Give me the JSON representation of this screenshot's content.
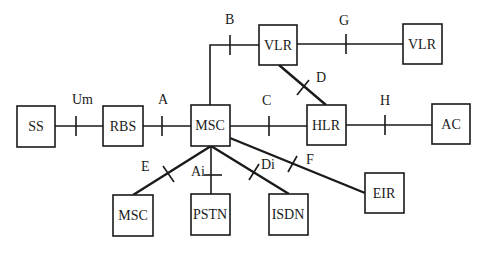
{
  "diagram": {
    "title": "",
    "nodes": {
      "ss": "SS",
      "rbs": "RBS",
      "msc": "MSC",
      "hlr": "HLR",
      "ac": "AC",
      "vlr1": "VLR",
      "vlr2": "VLR",
      "msc2": "MSC",
      "pstn": "PSTN",
      "isdn": "ISDN",
      "eir": "EIR"
    },
    "interfaces": {
      "um": "Um",
      "a": "A",
      "b": "B",
      "c": "C",
      "d": "D",
      "e": "E",
      "f": "F",
      "g": "G",
      "h": "H",
      "ai": "Ai",
      "di": "Di"
    },
    "edges": [
      {
        "from": "SS",
        "to": "RBS",
        "interface": "Um"
      },
      {
        "from": "RBS",
        "to": "MSC",
        "interface": "A"
      },
      {
        "from": "MSC",
        "to": "VLR",
        "interface": "B"
      },
      {
        "from": "MSC",
        "to": "HLR",
        "interface": "C"
      },
      {
        "from": "VLR",
        "to": "HLR",
        "interface": "D"
      },
      {
        "from": "VLR",
        "to": "VLR",
        "interface": "G"
      },
      {
        "from": "HLR",
        "to": "AC",
        "interface": "H"
      },
      {
        "from": "MSC",
        "to": "MSC",
        "interface": "E"
      },
      {
        "from": "MSC",
        "to": "PSTN",
        "interface": "Ai"
      },
      {
        "from": "MSC",
        "to": "ISDN",
        "interface": "Di"
      },
      {
        "from": "MSC",
        "to": "EIR",
        "interface": "F"
      }
    ]
  }
}
